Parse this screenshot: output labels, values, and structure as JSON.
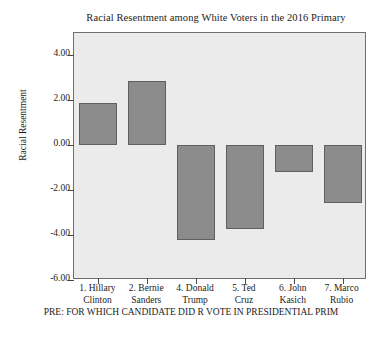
{
  "chart_data": {
    "type": "bar",
    "title": "Racial Resentment among White Voters in the 2016 Primary",
    "xlabel": "PRE: FOR WHICH CANDIDATE DID R VOTE IN PRESIDENTIAL PRIM",
    "ylabel": "Racial Resentment",
    "categories": [
      "1. Hillary Clinton",
      "2. Bernie Sanders",
      "4. Donald Trump",
      "5. Ted Cruz",
      "6. John Kasich",
      "7. Marco Rubio"
    ],
    "category_lines": [
      [
        "1. Hillary",
        "Clinton"
      ],
      [
        "2. Bernie",
        "Sanders"
      ],
      [
        "4. Donald",
        "Trump"
      ],
      [
        "5. Ted",
        "Cruz"
      ],
      [
        "6. John",
        "Kasich"
      ],
      [
        "7. Marco",
        "Rubio"
      ]
    ],
    "values": [
      1.9,
      2.85,
      -4.2,
      -3.75,
      -1.2,
      -2.55
    ],
    "ylim": [
      -6.0,
      5.0
    ],
    "yticks": [
      4.0,
      2.0,
      0.0,
      -2.0,
      -4.0,
      -6.0
    ],
    "ytick_labels": [
      "4.00",
      "2.00",
      "0.00",
      "-2.00",
      "-4.00",
      "-6.00"
    ],
    "grid": false,
    "legend": "none",
    "bar_color": "#8c8c8c",
    "bar_edge_color": "#5f5f5f",
    "plot_background": "#ebebeb",
    "figure_background": "#ffffff",
    "axis_color": "#6e6e6e"
  }
}
